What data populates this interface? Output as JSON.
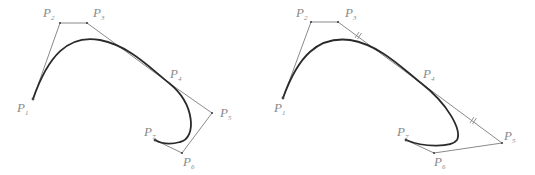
{
  "diagram": {
    "type": "bezier-spline-comparison",
    "colors": {
      "control_polygon": "#8a8a8a",
      "curve": "#2a2a2a",
      "labels": "#8a8a8a"
    },
    "panels": [
      {
        "name": "left",
        "points": [
          {
            "label": "P",
            "sub": "1",
            "x": 33,
            "y": 99,
            "lx": 17,
            "ly": 112
          },
          {
            "label": "P",
            "sub": "2",
            "x": 60,
            "y": 23,
            "lx": 43,
            "ly": 17
          },
          {
            "label": "P",
            "sub": "3",
            "x": 87,
            "y": 23,
            "lx": 93,
            "ly": 17
          },
          {
            "label": "P",
            "sub": "4",
            "x": 169,
            "y": 83,
            "lx": 170,
            "ly": 79
          },
          {
            "label": "P",
            "sub": "5",
            "x": 212,
            "y": 113,
            "lx": 220,
            "ly": 117
          },
          {
            "label": "P",
            "sub": "6",
            "x": 182,
            "y": 153,
            "lx": 183,
            "ly": 166
          },
          {
            "label": "P",
            "sub": "7",
            "x": 155,
            "y": 140,
            "lx": 144,
            "ly": 136
          }
        ]
      },
      {
        "name": "right",
        "points": [
          {
            "label": "P",
            "sub": "1",
            "x": 283,
            "y": 98,
            "lx": 274,
            "ly": 112
          },
          {
            "label": "P",
            "sub": "2",
            "x": 311,
            "y": 22,
            "lx": 296,
            "ly": 17
          },
          {
            "label": "P",
            "sub": "3",
            "x": 338,
            "y": 22,
            "lx": 345,
            "ly": 17
          },
          {
            "label": "P",
            "sub": "4",
            "x": 421,
            "y": 83,
            "lx": 423,
            "ly": 79
          },
          {
            "label": "P",
            "sub": "5",
            "x": 502,
            "y": 143,
            "lx": 504,
            "ly": 140
          },
          {
            "label": "P",
            "sub": "6",
            "x": 434,
            "y": 153,
            "lx": 434,
            "ly": 166
          },
          {
            "label": "P",
            "sub": "7",
            "x": 406,
            "y": 140,
            "lx": 397,
            "ly": 136
          }
        ]
      }
    ]
  }
}
